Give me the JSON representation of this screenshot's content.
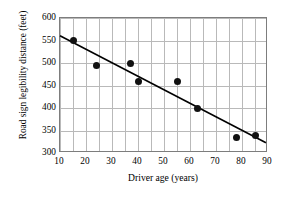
{
  "chart_data": {
    "type": "scatter",
    "title": "",
    "xlabel": "Driver age (years)",
    "ylabel": "Road sign legibility distance (feet)",
    "xlim": [
      10,
      90
    ],
    "ylim": [
      300,
      600
    ],
    "xticks": [
      10,
      20,
      30,
      40,
      50,
      60,
      70,
      80,
      90
    ],
    "yticks": [
      300,
      350,
      400,
      450,
      500,
      550,
      600
    ],
    "x_minor_step": 5,
    "grid": true,
    "legend": null,
    "point_color": "#111111",
    "line_color": "#000000",
    "grid_color": "#b9b9b9",
    "frame_color": "#7d7d7d",
    "x": [
      15,
      24,
      37,
      40,
      55,
      63,
      78,
      85
    ],
    "y": [
      550,
      495,
      500,
      460,
      460,
      400,
      335,
      340
    ],
    "points": [
      {
        "x": 15,
        "y": 550
      },
      {
        "x": 24,
        "y": 495
      },
      {
        "x": 37,
        "y": 500
      },
      {
        "x": 40,
        "y": 460
      },
      {
        "x": 55,
        "y": 460
      },
      {
        "x": 63,
        "y": 400
      },
      {
        "x": 78,
        "y": 335
      },
      {
        "x": 85,
        "y": 340
      }
    ],
    "trendline": {
      "x0": 10,
      "y0": 560,
      "x1": 90,
      "y1": 320
    }
  }
}
